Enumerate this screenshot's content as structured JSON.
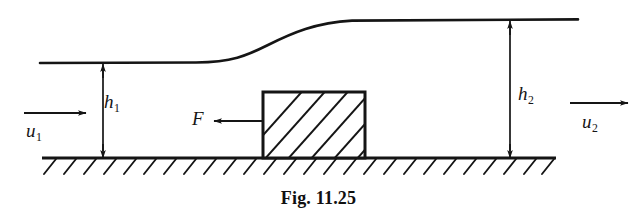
{
  "figure": {
    "caption": "Fig. 11.25"
  },
  "labels": {
    "h1": {
      "base": "h",
      "sub": "1"
    },
    "h2": {
      "base": "h",
      "sub": "2"
    },
    "u1": {
      "base": "u",
      "sub": "1"
    },
    "u2": {
      "base": "u",
      "sub": "2"
    },
    "force": "F"
  },
  "colors": {
    "line": "#151515",
    "background": "#ffffff",
    "text": "#151515"
  },
  "geometry": {
    "upstream_water_surface_y": 63,
    "downstream_water_surface_y": 20,
    "channel_bed_y": 158,
    "bed_left_x": 42,
    "bed_right_x": 556,
    "block": {
      "left": 262,
      "right": 366,
      "top": 91,
      "bottom": 158
    },
    "h1_dimension_x": 103,
    "h2_dimension_x": 510,
    "u1_arrow": {
      "x1": 24,
      "x2": 86,
      "y": 113
    },
    "u2_arrow": {
      "x1": 570,
      "x2": 628,
      "y": 103
    },
    "force_arrow": {
      "x1": 262,
      "x2": 212,
      "y": 121
    }
  }
}
